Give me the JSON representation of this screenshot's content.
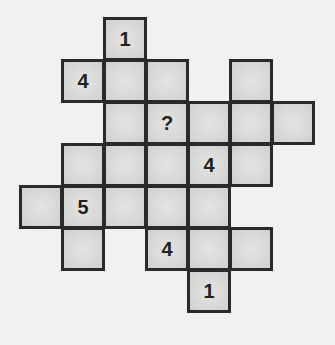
{
  "puzzle": {
    "cell_size": 42,
    "cells": [
      {
        "row": 0,
        "col": 2,
        "value": "1"
      },
      {
        "row": 1,
        "col": 1,
        "value": "4"
      },
      {
        "row": 1,
        "col": 2,
        "value": ""
      },
      {
        "row": 1,
        "col": 3,
        "value": ""
      },
      {
        "row": 1,
        "col": 5,
        "value": ""
      },
      {
        "row": 2,
        "col": 2,
        "value": ""
      },
      {
        "row": 2,
        "col": 3,
        "value": "?"
      },
      {
        "row": 2,
        "col": 4,
        "value": ""
      },
      {
        "row": 2,
        "col": 5,
        "value": ""
      },
      {
        "row": 2,
        "col": 6,
        "value": ""
      },
      {
        "row": 3,
        "col": 1,
        "value": ""
      },
      {
        "row": 3,
        "col": 2,
        "value": ""
      },
      {
        "row": 3,
        "col": 3,
        "value": ""
      },
      {
        "row": 3,
        "col": 4,
        "value": "4"
      },
      {
        "row": 3,
        "col": 5,
        "value": ""
      },
      {
        "row": 4,
        "col": 0,
        "value": ""
      },
      {
        "row": 4,
        "col": 1,
        "value": "5"
      },
      {
        "row": 4,
        "col": 2,
        "value": ""
      },
      {
        "row": 4,
        "col": 3,
        "value": ""
      },
      {
        "row": 4,
        "col": 4,
        "value": ""
      },
      {
        "row": 5,
        "col": 1,
        "value": ""
      },
      {
        "row": 5,
        "col": 3,
        "value": "4"
      },
      {
        "row": 5,
        "col": 4,
        "value": ""
      },
      {
        "row": 5,
        "col": 5,
        "value": ""
      },
      {
        "row": 6,
        "col": 4,
        "value": "1"
      }
    ]
  }
}
